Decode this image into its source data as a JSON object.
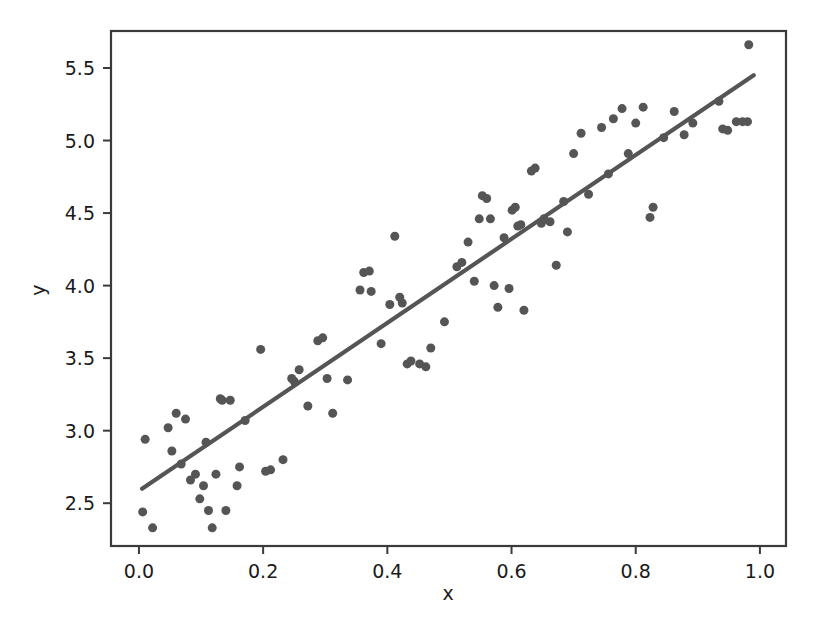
{
  "chart_data": {
    "type": "scatter",
    "title": "",
    "xlabel": "x",
    "ylabel": "y",
    "xlim": [
      -0.045,
      1.042
    ],
    "ylim": [
      2.205,
      5.755
    ],
    "xticks": [
      0.0,
      0.2,
      0.4,
      0.6,
      0.8,
      1.0
    ],
    "xticklabels": [
      "0.0",
      "0.2",
      "0.4",
      "0.6",
      "0.8",
      "1.0"
    ],
    "yticks": [
      2.5,
      3.0,
      3.5,
      4.0,
      4.5,
      5.0,
      5.5
    ],
    "yticklabels": [
      "2.5",
      "3.0",
      "3.5",
      "4.0",
      "4.5",
      "5.0",
      "5.5"
    ],
    "grid": false,
    "legend": null,
    "marker_color": "#555555",
    "line_color": "#555555",
    "marker_size": 9,
    "series": [
      {
        "name": "observations",
        "type": "scatter",
        "points": [
          [
            0.006,
            2.44
          ],
          [
            0.01,
            2.94
          ],
          [
            0.022,
            2.33
          ],
          [
            0.047,
            3.02
          ],
          [
            0.053,
            2.86
          ],
          [
            0.06,
            3.12
          ],
          [
            0.068,
            2.77
          ],
          [
            0.075,
            3.08
          ],
          [
            0.083,
            2.66
          ],
          [
            0.091,
            2.7
          ],
          [
            0.098,
            2.53
          ],
          [
            0.104,
            2.62
          ],
          [
            0.108,
            2.92
          ],
          [
            0.112,
            2.45
          ],
          [
            0.118,
            2.33
          ],
          [
            0.124,
            2.7
          ],
          [
            0.131,
            3.22
          ],
          [
            0.134,
            3.21
          ],
          [
            0.14,
            2.45
          ],
          [
            0.147,
            3.21
          ],
          [
            0.158,
            2.62
          ],
          [
            0.162,
            2.75
          ],
          [
            0.171,
            3.07
          ],
          [
            0.196,
            3.56
          ],
          [
            0.204,
            2.72
          ],
          [
            0.212,
            2.73
          ],
          [
            0.232,
            2.8
          ],
          [
            0.246,
            3.36
          ],
          [
            0.25,
            3.34
          ],
          [
            0.258,
            3.42
          ],
          [
            0.272,
            3.17
          ],
          [
            0.288,
            3.62
          ],
          [
            0.296,
            3.64
          ],
          [
            0.303,
            3.36
          ],
          [
            0.312,
            3.12
          ],
          [
            0.336,
            3.35
          ],
          [
            0.356,
            3.97
          ],
          [
            0.362,
            4.09
          ],
          [
            0.371,
            4.1
          ],
          [
            0.374,
            3.96
          ],
          [
            0.39,
            3.6
          ],
          [
            0.404,
            3.87
          ],
          [
            0.412,
            4.34
          ],
          [
            0.42,
            3.92
          ],
          [
            0.424,
            3.88
          ],
          [
            0.432,
            3.46
          ],
          [
            0.438,
            3.48
          ],
          [
            0.452,
            3.46
          ],
          [
            0.462,
            3.44
          ],
          [
            0.47,
            3.57
          ],
          [
            0.492,
            3.75
          ],
          [
            0.512,
            4.13
          ],
          [
            0.52,
            4.16
          ],
          [
            0.53,
            4.3
          ],
          [
            0.54,
            4.03
          ],
          [
            0.548,
            4.46
          ],
          [
            0.553,
            4.62
          ],
          [
            0.56,
            4.6
          ],
          [
            0.566,
            4.46
          ],
          [
            0.572,
            4.0
          ],
          [
            0.578,
            3.85
          ],
          [
            0.588,
            4.33
          ],
          [
            0.596,
            3.98
          ],
          [
            0.601,
            4.52
          ],
          [
            0.606,
            4.54
          ],
          [
            0.61,
            4.41
          ],
          [
            0.615,
            4.42
          ],
          [
            0.62,
            3.83
          ],
          [
            0.632,
            4.79
          ],
          [
            0.638,
            4.81
          ],
          [
            0.648,
            4.43
          ],
          [
            0.652,
            4.46
          ],
          [
            0.662,
            4.44
          ],
          [
            0.672,
            4.14
          ],
          [
            0.684,
            4.58
          ],
          [
            0.69,
            4.37
          ],
          [
            0.7,
            4.91
          ],
          [
            0.712,
            5.05
          ],
          [
            0.724,
            4.63
          ],
          [
            0.745,
            5.09
          ],
          [
            0.756,
            4.77
          ],
          [
            0.764,
            5.15
          ],
          [
            0.778,
            5.22
          ],
          [
            0.788,
            4.91
          ],
          [
            0.8,
            5.12
          ],
          [
            0.812,
            5.23
          ],
          [
            0.823,
            4.47
          ],
          [
            0.828,
            4.54
          ],
          [
            0.845,
            5.02
          ],
          [
            0.862,
            5.2
          ],
          [
            0.878,
            5.04
          ],
          [
            0.892,
            5.12
          ],
          [
            0.934,
            5.27
          ],
          [
            0.94,
            5.08
          ],
          [
            0.948,
            5.07
          ],
          [
            0.962,
            5.13
          ],
          [
            0.972,
            5.13
          ],
          [
            0.98,
            5.13
          ],
          [
            0.982,
            5.66
          ]
        ]
      },
      {
        "name": "regression-line",
        "type": "line",
        "endpoints": [
          [
            0.005,
            2.6
          ],
          [
            0.99,
            5.45
          ]
        ],
        "slope": 2.893,
        "intercept": 2.585
      }
    ]
  }
}
